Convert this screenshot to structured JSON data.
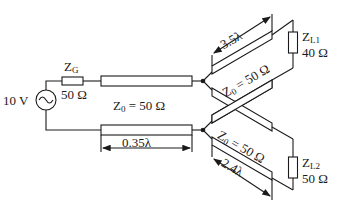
{
  "diagram": {
    "type": "circuit",
    "title": "",
    "source": {
      "label": "10 V",
      "symbol": "ac-voltage-source"
    },
    "generator_impedance": {
      "name": "Z",
      "sub": "G",
      "value": "50 Ω"
    },
    "main_line": {
      "label": "Z0 = 50 Ω",
      "z_name": "Z",
      "z_sub": "0",
      "z_value": "= 50 Ω",
      "length": "0.35λ"
    },
    "branch_1": {
      "label": "Z0 = 50 Ω",
      "z_name": "Z",
      "z_sub": "0",
      "z_value": "= 50 Ω",
      "length": "3.5λ"
    },
    "branch_2": {
      "label": "Z0 = 50 Ω",
      "z_name": "Z",
      "z_sub": "0",
      "z_value": "= 50 Ω",
      "length": "2.4λ"
    },
    "load_1": {
      "name": "Z",
      "sub": "L1",
      "value": "40 Ω"
    },
    "load_2": {
      "name": "Z",
      "sub": "L2",
      "value": "50 Ω"
    },
    "colors": {
      "stroke": "#1a1a1a",
      "background": "#ffffff"
    }
  }
}
